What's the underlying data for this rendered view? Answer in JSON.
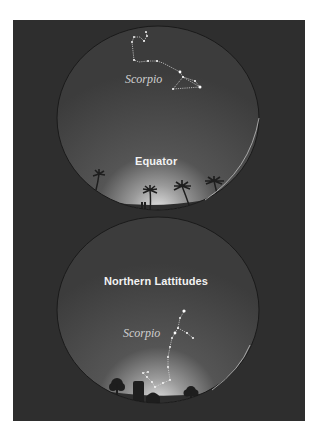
{
  "figure": {
    "background_color": "#2e2e2e",
    "sky_color": "#454545",
    "horizon_glow_color": "#d8d8d8",
    "panels": [
      {
        "id": "equator",
        "location_label": "Equator",
        "constellation_label": "Scorpio",
        "foreground": "palm-trees"
      },
      {
        "id": "northern",
        "location_label": "Northern Lattitudes",
        "constellation_label": "Scorpio",
        "foreground": "trees-and-silo"
      }
    ]
  }
}
